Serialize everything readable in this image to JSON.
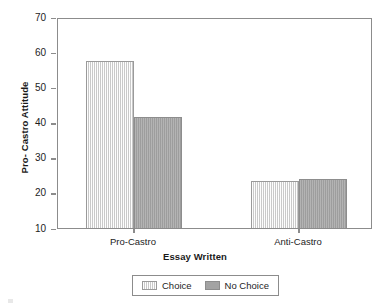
{
  "chart_data": {
    "type": "bar",
    "title": "",
    "xlabel": "Essay Written",
    "ylabel": "Pro- Castro Attitude",
    "categories": [
      "Pro-Castro",
      "Anti-Castro"
    ],
    "series": [
      {
        "name": "Choice",
        "values": [
          57.5,
          23.3
        ],
        "color": "#dddddd"
      },
      {
        "name": "No Choice",
        "values": [
          41.5,
          24.0
        ],
        "color": "#a3a3a3"
      }
    ],
    "ylim": [
      10,
      70
    ],
    "yticks": [
      70,
      60,
      50,
      40,
      30,
      20,
      10
    ],
    "ytick_labels": [
      "70",
      "60",
      "50",
      "40",
      "30",
      "20",
      "10"
    ],
    "grid": false,
    "legend_position": "bottom-center",
    "legend_entries": [
      "Choice",
      "No Choice"
    ]
  },
  "axes": {
    "y_title": "Pro- Castro Attitude",
    "x_title": "Essay Written"
  }
}
